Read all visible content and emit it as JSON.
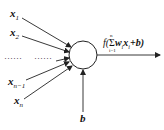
{
  "diagram": {
    "type": "artificial-neuron",
    "inputs": [
      {
        "label": "x",
        "sub": "1"
      },
      {
        "label": "x",
        "sub": "2"
      },
      {
        "label": "x",
        "sub": "n−1"
      },
      {
        "label": "x",
        "sub": "n"
      }
    ],
    "ellipsis_left": "······",
    "ellipsis_right": "······",
    "bias_label": "b",
    "output_formula": {
      "func": "f(",
      "sum_symbol": "Σ",
      "sum_upper": "n",
      "sum_lower": "i=1",
      "term": "w",
      "term_sub": "i",
      "var": "x",
      "var_sub": "i",
      "plus_bias": "+b)",
      "text": "f(Σ_{i=1}^{n} w_i x_i + b)"
    },
    "colors": {
      "stroke": "#222222",
      "background": "#ffffff"
    }
  }
}
